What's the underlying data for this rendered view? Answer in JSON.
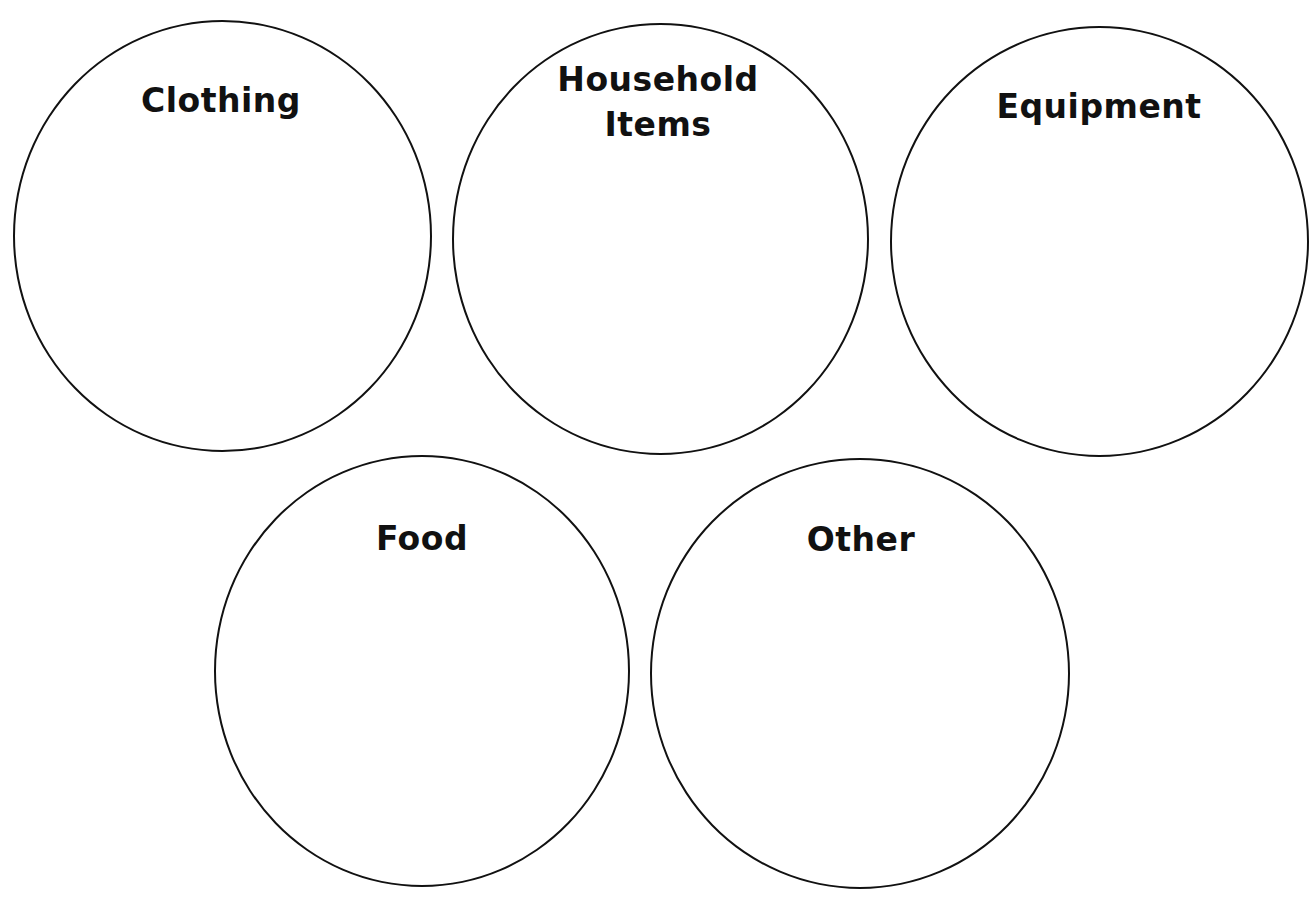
{
  "worksheet": {
    "circles": [
      {
        "id": "clothing",
        "label_lines": [
          "Clothing"
        ],
        "box": {
          "left": 13,
          "top": 20,
          "width": 419,
          "height": 432
        },
        "label_pos": {
          "center_x": 221,
          "top": 84
        }
      },
      {
        "id": "household-items",
        "label_lines": [
          "Household",
          "Items"
        ],
        "box": {
          "left": 452,
          "top": 23,
          "width": 417,
          "height": 432
        },
        "label_pos": {
          "center_x": 658,
          "top": 62
        }
      },
      {
        "id": "equipment",
        "label_lines": [
          "Equipment"
        ],
        "box": {
          "left": 890,
          "top": 26,
          "width": 419,
          "height": 431
        },
        "label_pos": {
          "center_x": 1099,
          "top": 90
        }
      },
      {
        "id": "food",
        "label_lines": [
          "Food"
        ],
        "box": {
          "left": 214,
          "top": 455,
          "width": 416,
          "height": 432
        },
        "label_pos": {
          "center_x": 422,
          "top": 522
        }
      },
      {
        "id": "other",
        "label_lines": [
          "Other"
        ],
        "box": {
          "left": 650,
          "top": 458,
          "width": 420,
          "height": 431
        },
        "label_pos": {
          "center_x": 861,
          "top": 523
        }
      }
    ],
    "colors": {
      "stroke": "#111111",
      "text": "#111111",
      "background": "#ffffff"
    }
  }
}
